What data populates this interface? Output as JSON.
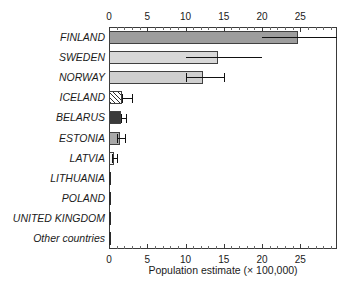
{
  "chart_data": {
    "type": "bar",
    "orientation": "horizontal",
    "title": "",
    "xlabel": "Population estimate (× 100,000)",
    "ylabel": "",
    "xlim": [
      0,
      29.8
    ],
    "grid": false,
    "legend": null,
    "axis_positions": [
      "top",
      "bottom"
    ],
    "tick_labels": [
      "0",
      "5",
      "10",
      "15",
      "20",
      "25"
    ],
    "tick_values": [
      0,
      5,
      10,
      15,
      20,
      25
    ],
    "minor_tick_step": 1,
    "categories": [
      "FINLAND",
      "SWEDEN",
      "NORWAY",
      "ICELAND",
      "BELARUS",
      "ESTONIA",
      "LATVIA",
      "LITHUANIA",
      "POLAND",
      "UNITED KINGDOM",
      "Other countries"
    ],
    "values": [
      24.7,
      14.2,
      12.3,
      1.7,
      1.6,
      1.5,
      0.7,
      0.2,
      0.05,
      0.05,
      0.03
    ],
    "errors_low": [
      20.0,
      10.0,
      10.0,
      1.7,
      1.6,
      1.0,
      0.4,
      null,
      null,
      null,
      null
    ],
    "errors_high": [
      29.8,
      20.0,
      15.0,
      3.0,
      2.2,
      2.1,
      1.1,
      null,
      null,
      null,
      null
    ],
    "fills": [
      "#9d9d9d",
      "#d8d8d8",
      "#cfcfcf",
      "hatch",
      "#3a3a3a",
      "#a8a8a8",
      "#f2f2f2",
      "#2a2a2a",
      "#2a2a2a",
      "#2a2a2a",
      "#2a2a2a"
    ]
  },
  "colors": {
    "axis": "#3a3a3a",
    "text": "#1a1a1a",
    "error": "#111111",
    "background": "#ffffff"
  }
}
